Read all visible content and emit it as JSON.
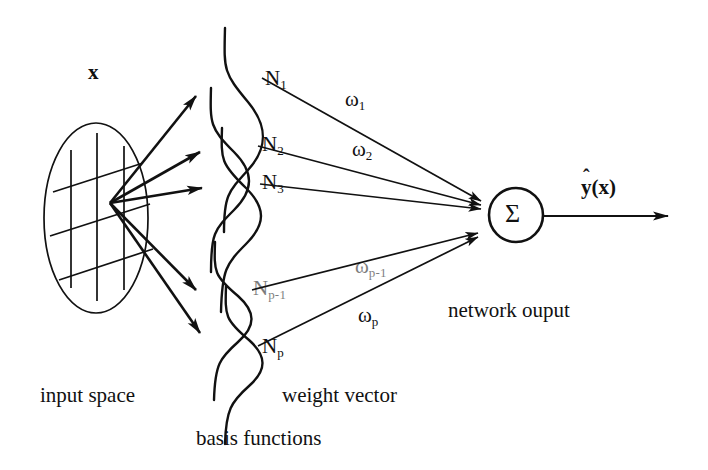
{
  "figure": {
    "ink_color": "#111111",
    "background_color": "#ffffff",
    "width": 708,
    "height": 470
  },
  "input_space": {
    "vector_label": "x",
    "caption": "input space"
  },
  "basis_layer": {
    "caption": "basis functions",
    "nodes": [
      {
        "base": "N",
        "sub": "1"
      },
      {
        "base": "N",
        "sub": "2"
      },
      {
        "base": "N",
        "sub": "3"
      },
      {
        "base": "N",
        "sub": "p-1"
      },
      {
        "base": "N",
        "sub": "p"
      }
    ]
  },
  "weights": {
    "caption": "weight vector",
    "items": [
      {
        "base": "ω",
        "sub": "1"
      },
      {
        "base": "ω",
        "sub": "2"
      },
      {
        "base": "ω",
        "sub": "p-1"
      },
      {
        "base": "ω",
        "sub": "p"
      }
    ]
  },
  "summation": {
    "symbol": "Σ"
  },
  "output": {
    "hat": "ˆ",
    "base": "y",
    "arg": "(x)",
    "caption": "network ouput"
  }
}
